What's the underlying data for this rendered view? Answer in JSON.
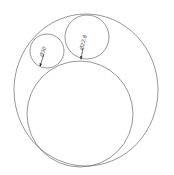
{
  "diagram": {
    "type": "tangent-circles-drawing",
    "stroke_color": "#6a6a6a",
    "background": "#ffffff",
    "shapes": {
      "outer": {
        "cx": 86,
        "cy": 90,
        "rx": 72,
        "ry": 76
      },
      "large_inner": {
        "cx": 80,
        "cy": 114,
        "r": 53
      },
      "top_small": {
        "cx": 87,
        "cy": 37,
        "r": 22
      },
      "left_small": {
        "cx": 47,
        "cy": 51,
        "r": 17
      }
    },
    "dimensions": {
      "left_small_label": "Ø30",
      "top_small_label": "Ø22.8"
    }
  }
}
